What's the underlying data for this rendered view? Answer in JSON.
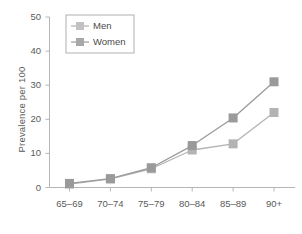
{
  "chart_data": {
    "type": "line",
    "title": "",
    "xlabel": "",
    "ylabel": "Prevalence per 100",
    "categories": [
      "65–69",
      "70–74",
      "75–79",
      "80–84",
      "85–89",
      "90+"
    ],
    "ylim": [
      0,
      50
    ],
    "yticks": [
      0,
      10,
      20,
      30,
      40,
      50
    ],
    "ytick_labels": [
      "0",
      "10",
      "20",
      "30",
      "40",
      "50"
    ],
    "grid": false,
    "legend_position": "upper left",
    "series": [
      {
        "name": "Men",
        "color": "#b3b3b3",
        "marker": "square",
        "values": [
          1.0,
          2.5,
          5.5,
          11.0,
          12.8,
          22.0
        ]
      },
      {
        "name": "Women",
        "color": "#9a9a9a",
        "marker": "square",
        "values": [
          1.2,
          2.6,
          5.8,
          12.3,
          20.4,
          31.0
        ]
      }
    ]
  },
  "legend": {
    "entries": [
      {
        "label": "Men"
      },
      {
        "label": "Women"
      }
    ]
  },
  "colors": {
    "men": "#b3b3b3",
    "women": "#9a9a9a",
    "axis": "#b5b5b5",
    "text": "#5a5a5a",
    "background": "#ffffff"
  }
}
